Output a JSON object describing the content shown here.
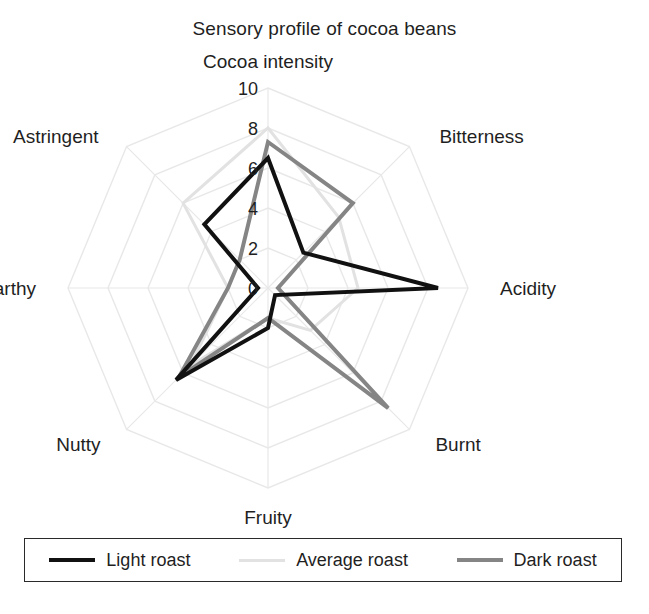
{
  "chart_title": "Sensory profile of cocoa beans",
  "legend": {
    "items": [
      {
        "label": "Light roast",
        "color": "#111111",
        "width": 4
      },
      {
        "label": "Average roast",
        "color": "#e2e2e2",
        "width": 3
      },
      {
        "label": "Dark roast",
        "color": "#858585",
        "width": 4
      }
    ]
  },
  "chart_data": {
    "type": "radar",
    "title": "Sensory profile of cocoa beans",
    "xlabel": "",
    "ylabel": "",
    "categories": [
      "Cocoa intensity",
      "Bitterness",
      "Acidity",
      "Burnt",
      "Fruity",
      "Nutty",
      "Earthy",
      "Astringent"
    ],
    "tick_labels": [
      "0",
      "2",
      "4",
      "6",
      "8",
      "10"
    ],
    "tick_values": [
      0,
      2,
      4,
      6,
      8,
      10
    ],
    "rlim": [
      0,
      10
    ],
    "grid": true,
    "grid_color": "#e8e8e8",
    "legend_position": "bottom",
    "series": [
      {
        "name": "Light roast",
        "color": "#111111",
        "line_width": 4,
        "values": [
          6.5,
          2.5,
          8.5,
          0.5,
          2.0,
          6.5,
          0.5,
          4.5
        ]
      },
      {
        "name": "Average roast",
        "color": "#e2e2e2",
        "line_width": 3,
        "values": [
          8.0,
          5.0,
          4.5,
          3.0,
          1.5,
          5.5,
          2.0,
          6.0
        ]
      },
      {
        "name": "Dark roast",
        "color": "#858585",
        "line_width": 4,
        "values": [
          7.3,
          6.0,
          0.5,
          8.5,
          1.5,
          6.3,
          2.0,
          2.0
        ]
      }
    ]
  },
  "geometry": {
    "center_x": 268,
    "center_y": 288,
    "radius": 200
  }
}
